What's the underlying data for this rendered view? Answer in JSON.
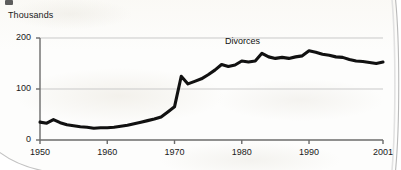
{
  "chart_data": {
    "type": "line",
    "title": "",
    "xlabel": "",
    "ylabel": "Thousands",
    "ylim": [
      0,
      200
    ],
    "xlim": [
      1950,
      2001
    ],
    "grid": true,
    "legend_position": "inline-annotation",
    "y_ticks": [
      "0",
      "100",
      "200"
    ],
    "y_tick_values": [
      0,
      100,
      200
    ],
    "x_ticks": [
      "1950",
      "1960",
      "1970",
      "1980",
      "1990",
      "2001"
    ],
    "x_tick_values": [
      1950,
      1960,
      1970,
      1980,
      1990,
      2001
    ],
    "series": [
      {
        "name": "Divorces",
        "annotation": "Divorces",
        "color": "#111111",
        "x": [
          1950,
          1951,
          1952,
          1953,
          1954,
          1955,
          1956,
          1957,
          1958,
          1959,
          1960,
          1961,
          1962,
          1963,
          1964,
          1965,
          1966,
          1967,
          1968,
          1969,
          1970,
          1971,
          1972,
          1973,
          1974,
          1975,
          1976,
          1977,
          1978,
          1979,
          1980,
          1981,
          1982,
          1983,
          1984,
          1985,
          1986,
          1987,
          1988,
          1989,
          1990,
          1991,
          1992,
          1993,
          1994,
          1995,
          1996,
          1997,
          1998,
          1999,
          2000,
          2001
        ],
        "values": [
          35,
          33,
          40,
          34,
          30,
          28,
          26,
          25,
          23,
          24,
          24,
          25,
          27,
          29,
          32,
          35,
          38,
          41,
          45,
          55,
          65,
          125,
          110,
          115,
          120,
          128,
          137,
          148,
          144,
          147,
          155,
          153,
          155,
          170,
          163,
          160,
          162,
          160,
          163,
          165,
          175,
          172,
          168,
          166,
          163,
          162,
          158,
          155,
          154,
          152,
          150,
          153
        ]
      }
    ]
  },
  "annotations": {
    "y_axis_title": "Thousands",
    "series_label": "Divorces"
  }
}
